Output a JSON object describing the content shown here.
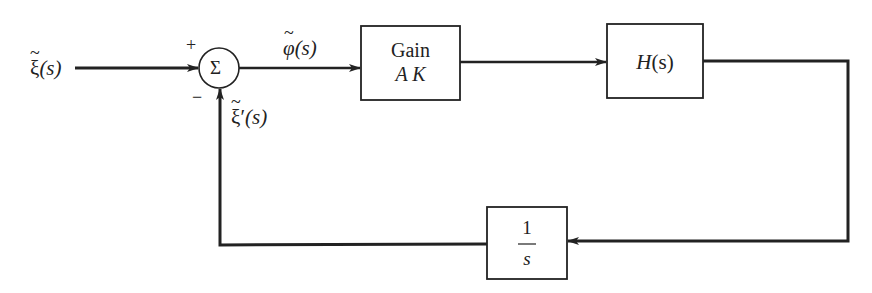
{
  "diagram": {
    "type": "feedback-block-diagram",
    "input": {
      "symbol": "ξ",
      "arg": "(s)"
    },
    "summing_junction": {
      "symbol": "Σ",
      "plus_sign": "+",
      "minus_sign": "−"
    },
    "error_signal": {
      "symbol": "φ",
      "arg": "(s)"
    },
    "feedback_signal": {
      "symbol": "ξ",
      "prime": "′",
      "arg": "(s)"
    },
    "blocks": [
      {
        "id": "gain",
        "line1": "Gain",
        "line2": "A K"
      },
      {
        "id": "plant",
        "label_main": "H",
        "label_arg": "(s)"
      },
      {
        "id": "integrator",
        "numerator": "1",
        "denominator": "s"
      }
    ],
    "colors": {
      "line": "#222222",
      "background": "#ffffff"
    }
  }
}
